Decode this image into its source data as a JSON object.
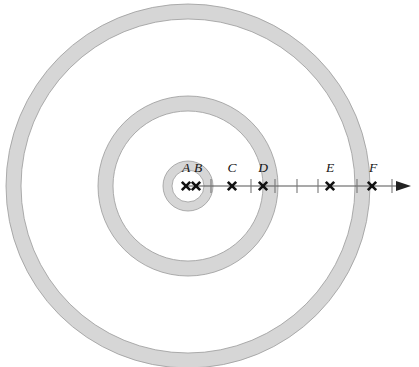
{
  "figure": {
    "background_color": "#ffffff",
    "band_color": "#d6d6d6",
    "outline_color": "#9a9a9a",
    "axis_color": "#555555",
    "marker_color": "#111111",
    "label_color": "#151515"
  },
  "chart_data": {
    "type": "scatter",
    "title": "",
    "xlabel": "",
    "ylabel": "",
    "center": {
      "x": 188,
      "y": 186
    },
    "rings": [
      {
        "name": "inner-ring",
        "inner_radius": 16,
        "outer_radius": 25
      },
      {
        "name": "middle-ring",
        "inner_radius": 75,
        "outer_radius": 90
      },
      {
        "name": "outer-ring",
        "inner_radius": 167,
        "outer_radius": 182
      }
    ],
    "axis": {
      "y": 186,
      "x_start": 188,
      "x_end": 396,
      "arrow_tip_x": 411,
      "ticks": [
        211,
        251,
        275,
        297,
        318,
        357,
        392
      ]
    },
    "points": [
      {
        "label": "A",
        "x": 186,
        "y": 186,
        "label_x": 186,
        "label_y": 172
      },
      {
        "label": "B",
        "x": 196,
        "y": 186,
        "label_x": 198,
        "label_y": 172
      },
      {
        "label": "C",
        "x": 232,
        "y": 186,
        "label_x": 232,
        "label_y": 172
      },
      {
        "label": "D",
        "x": 263,
        "y": 186,
        "label_x": 263,
        "label_y": 172
      },
      {
        "label": "E",
        "x": 330,
        "y": 186,
        "label_x": 330,
        "label_y": 172
      },
      {
        "label": "F",
        "x": 372,
        "y": 186,
        "label_x": 373,
        "label_y": 172
      }
    ],
    "legend": [],
    "annotations": []
  }
}
